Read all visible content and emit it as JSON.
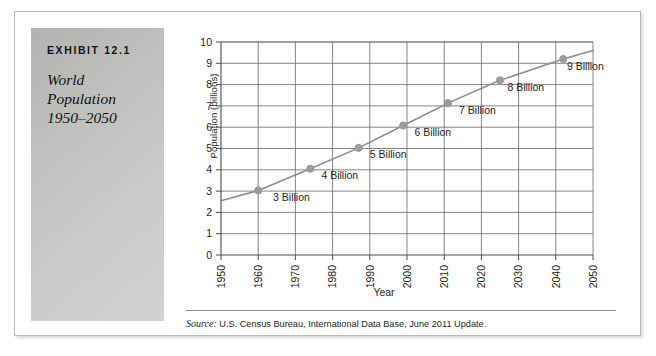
{
  "exhibit": {
    "number": "EXHIBIT 12.1",
    "title_lines": [
      "World",
      "Population",
      "1950–2050"
    ]
  },
  "source": {
    "prefix": "Source:",
    "text": " U.S. Census Bureau, International Data Base, June 2011 Update."
  },
  "colors": {
    "line": "#8c8c8c",
    "marker": "#9a9a9a",
    "grid": "#6f6f6f",
    "axis": "#4a4a4a",
    "panel_light": "#d2d2d0",
    "panel_dark": "#b2b2b0",
    "text": "#1d1d1d"
  },
  "chart_data": {
    "type": "line",
    "title": "World Population 1950–2050",
    "xlabel": "Year",
    "ylabel": "Population (billions)",
    "xlim": [
      1950,
      2050
    ],
    "ylim": [
      0,
      10
    ],
    "xticks": [
      1950,
      1960,
      1970,
      1980,
      1990,
      2000,
      2010,
      2020,
      2030,
      2040,
      2050
    ],
    "yticks": [
      0,
      1,
      2,
      3,
      4,
      5,
      6,
      7,
      8,
      9,
      10
    ],
    "grid": true,
    "legend": "none",
    "x": [
      1950,
      1960,
      1974,
      1987,
      1999,
      2011,
      2025,
      2042,
      2050
    ],
    "y": [
      2.55,
      3.03,
      4.05,
      5.03,
      6.08,
      7.13,
      8.2,
      9.2,
      9.6
    ],
    "series": [
      {
        "name": "World population",
        "values": [
          2.55,
          3.03,
          4.05,
          5.03,
          6.08,
          7.13,
          8.2,
          9.2,
          9.6
        ]
      }
    ],
    "markers": [
      {
        "year": 1960,
        "value": 3.03,
        "label": "3 Billion"
      },
      {
        "year": 1974,
        "value": 4.05,
        "label": "4 Billion"
      },
      {
        "year": 1987,
        "value": 5.03,
        "label": "5 Billion"
      },
      {
        "year": 1999,
        "value": 6.08,
        "label": "6 Billion"
      },
      {
        "year": 2011,
        "value": 7.13,
        "label": "7 Billion"
      },
      {
        "year": 2025,
        "value": 8.2,
        "label": "8 Billion"
      },
      {
        "year": 2042,
        "value": 9.2,
        "label": "9 Billion"
      }
    ],
    "annotations": [
      {
        "text": "3 Billion",
        "x": 1964,
        "y": 2.55
      },
      {
        "text": "4 Billion",
        "x": 1977,
        "y": 3.55
      },
      {
        "text": "5 Billion",
        "x": 1990,
        "y": 4.55
      },
      {
        "text": "6 Billion",
        "x": 2002,
        "y": 5.58
      },
      {
        "text": "7 Billion",
        "x": 2014,
        "y": 6.62
      },
      {
        "text": "8 Billion",
        "x": 2027,
        "y": 7.68
      },
      {
        "text": "9 Billion",
        "x": 2043,
        "y": 8.7
      }
    ]
  }
}
